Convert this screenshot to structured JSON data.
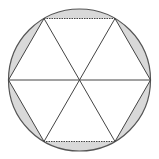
{
  "diagram": {
    "circle": {
      "cx": 79.5,
      "cy": 80,
      "r": 71,
      "stroke": "#555555"
    },
    "hexagon_vertices": [
      [
        8.5,
        80
      ],
      [
        44,
        18.5
      ],
      [
        115,
        18.5
      ],
      [
        150.5,
        80
      ],
      [
        115,
        141.5
      ],
      [
        44,
        141.5
      ]
    ],
    "center": [
      79.5,
      80
    ],
    "segment_fill": "#d9d9d9",
    "line_color": "#444444",
    "shaded_segments": 6,
    "triangles": 6
  }
}
